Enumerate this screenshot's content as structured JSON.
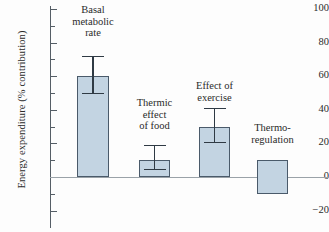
{
  "chart_data": {
    "type": "bar",
    "title": "",
    "xlabel": "",
    "ylabel": "Energy expenditure (% contribution)",
    "ylim": [
      -20,
      100
    ],
    "ytick_labels": [
      "100",
      "80",
      "60",
      "40",
      "20",
      "0",
      "−20"
    ],
    "ytick_values": [
      100,
      80,
      60,
      40,
      20,
      0,
      -20
    ],
    "minor_tick_values": [
      90,
      70,
      50,
      30,
      10,
      -10
    ],
    "grid": false,
    "legend": "none",
    "zero_line": true,
    "categories": [
      "Basal\nmetabolic\nrate",
      "Thermic\neffect\nof food",
      "Effect of\nexercise",
      "Thermo-\nregulation"
    ],
    "values": [
      60,
      10,
      30,
      10
    ],
    "bar_bottoms": [
      0,
      0,
      0,
      -10
    ],
    "error_high": [
      72,
      19,
      41,
      null
    ],
    "error_low": [
      50,
      5,
      21,
      null
    ],
    "colors": {
      "bar_fill": "#c3d4e2",
      "bar_edge": "#4a5a6a",
      "error_bar": "#2f3a44",
      "axis": "#555e66",
      "zero_line": "#9aa2a8",
      "text": "#2a2a2a"
    }
  },
  "axis": {
    "y_title": "Energy expenditure (% contribution)"
  }
}
